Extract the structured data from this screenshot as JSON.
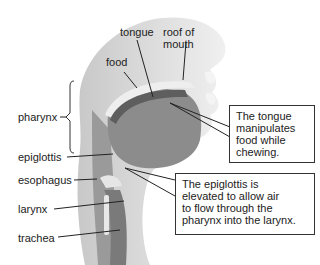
{
  "labels": {
    "tongue": "tongue",
    "roof_line1": "roof of",
    "roof_line2": "mouth",
    "food": "food",
    "pharynx": "pharynx",
    "epiglottis": "epiglottis",
    "esophagus": "esophagus",
    "larynx": "larynx",
    "trachea": "trachea"
  },
  "callouts": {
    "tongue_box": [
      "The tongue",
      "manipulates",
      "food while",
      "chewing."
    ],
    "epiglottis_box": [
      "The epiglottis is",
      "elevated to allow air",
      "to flow through the",
      "pharynx into the larynx."
    ]
  },
  "colors": {
    "tissue_light": "#d9d9d9",
    "tissue_mid": "#a6a6a6",
    "tissue_dark": "#7a7a7a",
    "tongue": "#8c8c8c",
    "food": "#5e5e5e"
  }
}
